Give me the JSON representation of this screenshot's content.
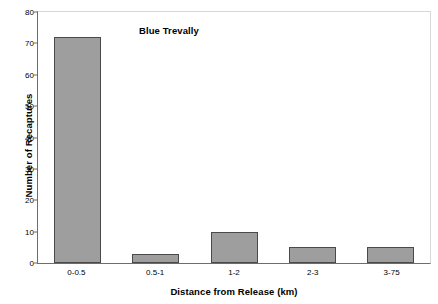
{
  "chart_data": {
    "type": "bar",
    "title": "Blue Trevally",
    "xlabel": "Distance from Release (km)",
    "ylabel": "Number of Recaptures",
    "categories": [
      "0-0.5",
      "0.5-1",
      "1-2",
      "2-3",
      "3-75"
    ],
    "values": [
      72,
      3,
      10,
      5,
      5
    ],
    "ylim": [
      0,
      80
    ],
    "ytick_values": [
      0,
      10,
      20,
      30,
      40,
      50,
      60,
      70,
      80
    ],
    "ytick_labels": [
      "0",
      "10",
      "20",
      "30",
      "40",
      "50",
      "60",
      "70",
      "80"
    ],
    "grid": false,
    "legend": null,
    "series": [
      {
        "name": "Blue Trevally",
        "values": [
          72,
          3,
          10,
          5,
          5
        ]
      }
    ]
  },
  "style": {
    "bar_fill": "#9e9e9e",
    "bar_edge": "#4a4a4a",
    "axis_color": "#6d6d6d",
    "plot_background": "#ffffff",
    "text_color": "#000000"
  }
}
